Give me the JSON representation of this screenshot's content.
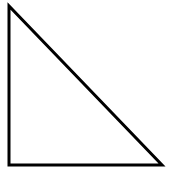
{
  "diagram": {
    "shape": "right-triangle",
    "stroke_color": "#000000",
    "fill_color": "#ffffff",
    "stroke_width": 3,
    "vertices": [
      {
        "x": 9,
        "y": 6
      },
      {
        "x": 9,
        "y": 165
      },
      {
        "x": 162,
        "y": 165
      }
    ]
  }
}
